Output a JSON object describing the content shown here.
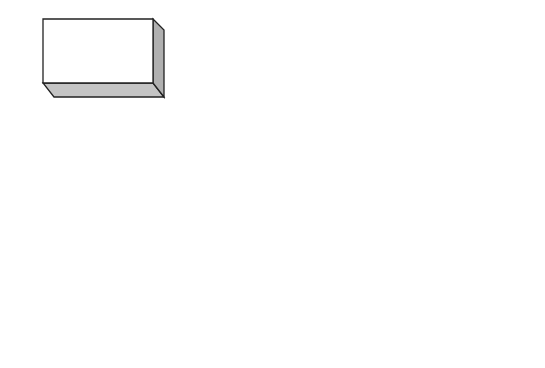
{
  "boxes": [
    {
      "id": "designing-the-database",
      "label": "Designing the\nDatabase",
      "x": 43,
      "y": 19,
      "w": 110,
      "h": 64
    },
    {
      "id": "identifying-keys",
      "label": "Identifying\nKeys",
      "x": 213,
      "y": 21,
      "w": 110,
      "h": 64
    },
    {
      "id": "developing-aggregation-strategies",
      "label": "Developing\nAggregation\nStrategies",
      "x": 385,
      "y": 22,
      "w": 106,
      "h": 65
    },
    {
      "id": "creating-indexing-strategies",
      "label": "Creating\nIndexing\nStrategies",
      "x": 241,
      "y": 150,
      "w": 106,
      "h": 64
    },
    {
      "id": "developing-partitioning-strategies",
      "label": "Developing\nPartitioning\nStrategies",
      "x": 412,
      "y": 143,
      "w": 106,
      "h": 64
    },
    {
      "id": "performing-capacity-planning",
      "label": "Performing\nCapacity\nPlanning",
      "x": 212,
      "y": 277,
      "w": 108,
      "h": 64
    },
    {
      "id": "creating-database-objects",
      "label": "Creating\nDatabase\nObjects",
      "x": 384,
      "y": 279,
      "w": 106,
      "h": 64
    }
  ],
  "stars": [
    {
      "id": "fact-tables",
      "label": "Fact\nTables",
      "cx": 63,
      "cy": 163,
      "r": 56
    },
    {
      "id": "lookup-tables",
      "label": "Lookup\nTables",
      "cx": 137,
      "cy": 232,
      "r": 56
    },
    {
      "id": "dimension-tables",
      "label": "Dimension\nTables",
      "cx": 63,
      "cy": 299,
      "r": 56
    }
  ],
  "style": {
    "stroke": "#222222",
    "face": "#ffffff",
    "side": "#b0b0b0",
    "bottom": "#c4c4c4",
    "depth": 11
  }
}
